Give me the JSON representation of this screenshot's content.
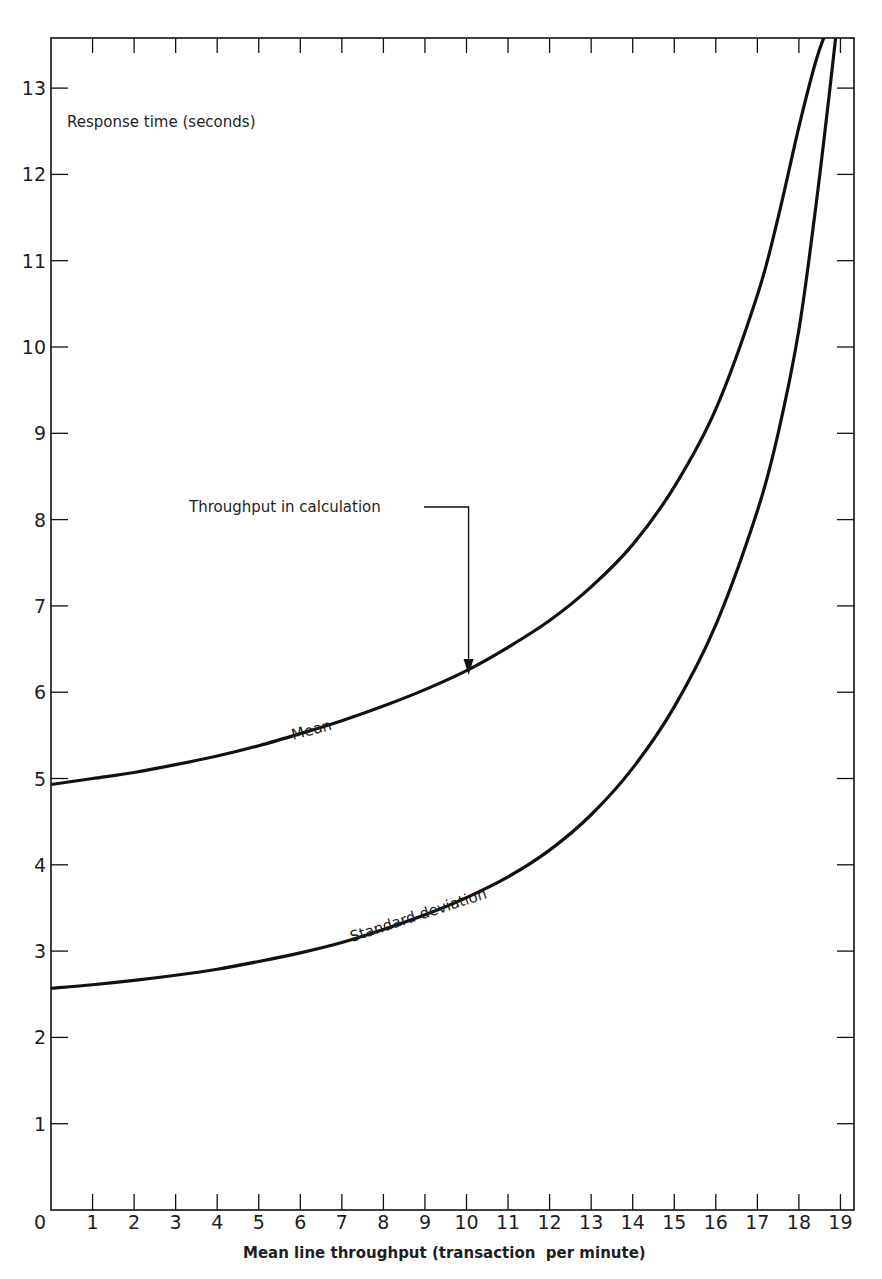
{
  "chart_data": {
    "type": "line",
    "title": "",
    "xlabel": "Mean line throughput (transaction  per minute)",
    "ylabel": "Response time (seconds)",
    "xlim": [
      0,
      19.35
    ],
    "ylim": [
      0,
      13.65
    ],
    "xticks": [
      0,
      1,
      2,
      3,
      4,
      5,
      6,
      7,
      8,
      9,
      10,
      11,
      12,
      13,
      14,
      15,
      16,
      17,
      18,
      19
    ],
    "xtick_labels": [
      "0",
      "1",
      "2",
      "3",
      "4",
      "5",
      "6",
      "7",
      "8",
      "9",
      "10",
      "11",
      "12",
      "13",
      "14",
      "15",
      "16",
      "17",
      "18",
      "19"
    ],
    "yticks": [
      1,
      2,
      3,
      4,
      5,
      6,
      7,
      8,
      9,
      10,
      11,
      12,
      13
    ],
    "ytick_labels": [
      "1",
      "2",
      "3",
      "4",
      "5",
      "6",
      "7",
      "8",
      "9",
      "10",
      "11",
      "12",
      "13"
    ],
    "grid": false,
    "legend": "none (curves labelled inline)",
    "series": [
      {
        "name": "Mean",
        "x": [
          0,
          1,
          2,
          3,
          4,
          5,
          6,
          7,
          8,
          9,
          10,
          11,
          12,
          13,
          14,
          15,
          16,
          17,
          17.5,
          18,
          18.4,
          18.65
        ],
        "y": [
          4.93,
          5.0,
          5.07,
          5.16,
          5.26,
          5.38,
          5.52,
          5.67,
          5.84,
          6.03,
          6.25,
          6.52,
          6.83,
          7.22,
          7.71,
          8.38,
          9.28,
          10.6,
          11.5,
          12.55,
          13.3,
          13.65
        ]
      },
      {
        "name": "Standard deviation",
        "x": [
          0,
          1,
          2,
          3,
          4,
          5,
          6,
          7,
          8,
          9,
          10,
          11,
          12,
          13,
          14,
          15,
          16,
          17,
          17.5,
          18,
          18.4,
          18.7,
          18.9
        ],
        "y": [
          2.57,
          2.61,
          2.66,
          2.72,
          2.79,
          2.88,
          2.98,
          3.1,
          3.25,
          3.42,
          3.62,
          3.86,
          4.17,
          4.58,
          5.12,
          5.83,
          6.78,
          8.1,
          9.0,
          10.2,
          11.6,
          12.8,
          13.65
        ]
      }
    ],
    "annotations": [
      {
        "text": "Throughput in calculation",
        "arrow_to": {
          "x": 10.05,
          "y": 6.2
        }
      },
      {
        "text": "Mean",
        "near": {
          "x": 6.7,
          "y": 5.65
        }
      },
      {
        "text": "Standard deviation",
        "near": {
          "x": 9.5,
          "y": 3.55
        }
      }
    ]
  },
  "labels": {
    "y_axis_title": "Response time (seconds)",
    "x_axis_title": "Mean line throughput (transaction  per minute)",
    "origin": "0",
    "annotation_arrow": "Throughput in calculation",
    "mean_label": "Mean",
    "std_label": "Standard deviation"
  },
  "style": {
    "ink": "#111111",
    "background": "#ffffff"
  }
}
